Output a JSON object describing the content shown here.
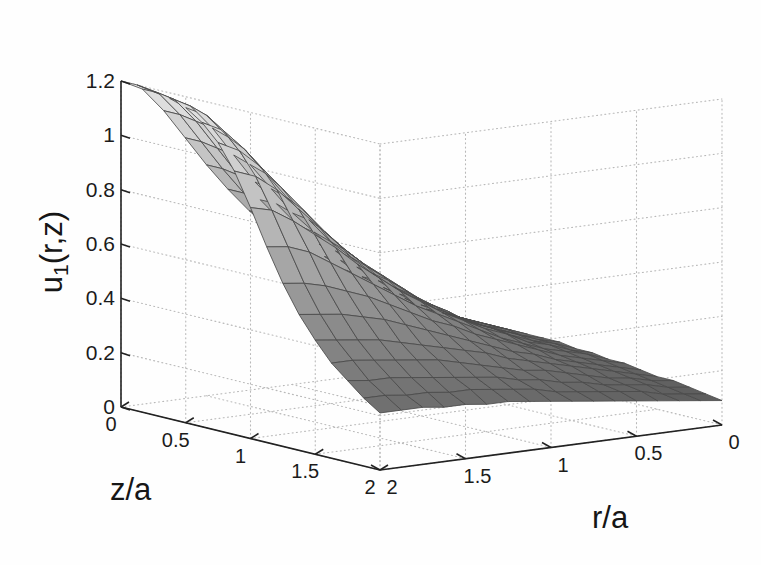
{
  "figure": {
    "background_color": "#ffffff",
    "axis_line_color": "#222222",
    "grid_color": "#b9b9b9",
    "mesh_line_color": "#4a4a4a"
  },
  "chart_data": {
    "type": "surface",
    "title": "",
    "zlabel_main": "u",
    "zlabel_sub": "1",
    "zlabel_tail": "(r,z)",
    "xlabel": "z/a",
    "ylabel": "r/a",
    "xticks": [
      "0",
      "0.5",
      "1",
      "1.5",
      "2"
    ],
    "xtickvals": [
      0,
      0.5,
      1,
      1.5,
      2
    ],
    "yticks": [
      "0",
      "0.5",
      "1",
      "1.5",
      "2"
    ],
    "ytickvals": [
      0,
      0.5,
      1,
      1.5,
      2
    ],
    "zticks": [
      "0",
      "0.2",
      "0.4",
      "0.6",
      "0.8",
      "1",
      "1.2"
    ],
    "ztickvals": [
      0,
      0.2,
      0.4,
      0.6,
      0.8,
      1.0,
      1.2
    ],
    "xlim": [
      0,
      2
    ],
    "ylim": [
      2,
      0
    ],
    "zlim": [
      0,
      1.2
    ],
    "xlabel_axis_direction": "z/a increases left-to-front",
    "ylabel_axis_direction": "r/a decreases left-to-right",
    "grid": true,
    "grid_style": "dotted",
    "legend": "none",
    "colormap": "gray",
    "shading": "faceted",
    "nx": 17,
    "ny": 17,
    "surface_z_rows": [
      [
        1.2,
        1.2,
        1.19,
        1.18,
        1.16,
        1.12,
        1.06,
        0.97,
        0.85,
        0.72,
        0.6,
        0.5,
        0.42,
        0.35,
        0.3,
        0.25,
        0.21
      ],
      [
        1.16,
        1.16,
        1.15,
        1.14,
        1.12,
        1.08,
        1.02,
        0.94,
        0.83,
        0.71,
        0.59,
        0.49,
        0.41,
        0.35,
        0.29,
        0.25,
        0.21
      ],
      [
        1.07,
        1.07,
        1.06,
        1.05,
        1.03,
        1.0,
        0.95,
        0.88,
        0.78,
        0.68,
        0.57,
        0.48,
        0.4,
        0.34,
        0.29,
        0.24,
        0.21
      ],
      [
        0.96,
        0.96,
        0.95,
        0.94,
        0.92,
        0.9,
        0.86,
        0.8,
        0.72,
        0.63,
        0.54,
        0.46,
        0.39,
        0.33,
        0.28,
        0.24,
        0.2
      ],
      [
        0.85,
        0.85,
        0.84,
        0.83,
        0.82,
        0.8,
        0.77,
        0.72,
        0.66,
        0.58,
        0.51,
        0.44,
        0.37,
        0.32,
        0.27,
        0.23,
        0.2
      ],
      [
        0.75,
        0.75,
        0.74,
        0.74,
        0.72,
        0.71,
        0.68,
        0.64,
        0.59,
        0.53,
        0.47,
        0.41,
        0.35,
        0.31,
        0.26,
        0.23,
        0.19
      ],
      [
        0.66,
        0.66,
        0.65,
        0.65,
        0.64,
        0.62,
        0.6,
        0.57,
        0.53,
        0.48,
        0.43,
        0.38,
        0.33,
        0.29,
        0.25,
        0.22,
        0.19
      ],
      [
        0.58,
        0.58,
        0.57,
        0.57,
        0.56,
        0.55,
        0.53,
        0.51,
        0.47,
        0.43,
        0.39,
        0.35,
        0.31,
        0.27,
        0.24,
        0.21,
        0.18
      ],
      [
        0.51,
        0.51,
        0.5,
        0.5,
        0.49,
        0.48,
        0.47,
        0.45,
        0.42,
        0.39,
        0.36,
        0.32,
        0.29,
        0.25,
        0.22,
        0.2,
        0.17
      ],
      [
        0.44,
        0.44,
        0.44,
        0.43,
        0.43,
        0.42,
        0.41,
        0.39,
        0.37,
        0.35,
        0.32,
        0.29,
        0.26,
        0.23,
        0.21,
        0.18,
        0.16
      ],
      [
        0.38,
        0.38,
        0.38,
        0.38,
        0.37,
        0.37,
        0.36,
        0.35,
        0.33,
        0.31,
        0.29,
        0.26,
        0.24,
        0.22,
        0.19,
        0.17,
        0.15
      ],
      [
        0.33,
        0.33,
        0.33,
        0.33,
        0.32,
        0.32,
        0.31,
        0.3,
        0.29,
        0.27,
        0.26,
        0.24,
        0.22,
        0.2,
        0.18,
        0.16,
        0.14
      ],
      [
        0.29,
        0.29,
        0.29,
        0.28,
        0.28,
        0.28,
        0.27,
        0.27,
        0.26,
        0.24,
        0.23,
        0.21,
        0.2,
        0.18,
        0.16,
        0.15,
        0.13
      ],
      [
        0.25,
        0.25,
        0.25,
        0.25,
        0.25,
        0.24,
        0.24,
        0.23,
        0.22,
        0.21,
        0.2,
        0.19,
        0.18,
        0.16,
        0.15,
        0.14,
        0.12
      ],
      [
        0.22,
        0.22,
        0.22,
        0.22,
        0.21,
        0.21,
        0.21,
        0.2,
        0.2,
        0.19,
        0.18,
        0.17,
        0.16,
        0.15,
        0.14,
        0.12,
        0.11
      ],
      [
        0.19,
        0.19,
        0.19,
        0.19,
        0.19,
        0.18,
        0.18,
        0.18,
        0.17,
        0.17,
        0.16,
        0.15,
        0.14,
        0.13,
        0.12,
        0.11,
        0.1
      ],
      [
        0.16,
        0.16,
        0.16,
        0.16,
        0.16,
        0.16,
        0.16,
        0.15,
        0.15,
        0.14,
        0.14,
        0.13,
        0.12,
        0.12,
        0.11,
        0.1,
        0.09
      ]
    ]
  },
  "geometry": {
    "origin_x": 121,
    "origin_y": 407,
    "front_x": 380,
    "front_y": 470,
    "right_x": 722,
    "right_y": 425,
    "z_top_y": 81,
    "z_bottom_y": 407
  }
}
